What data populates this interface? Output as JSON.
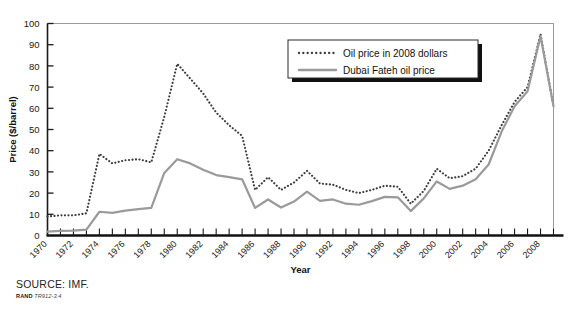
{
  "figure": {
    "source_text": "SOURCE: IMF.",
    "rand_label": "RAND",
    "rand_id": "TR912-3.4"
  },
  "chart_data": {
    "type": "line",
    "title": "",
    "xlabel": "Year",
    "ylabel": "Price ($/barrel)",
    "xlim": [
      1970,
      2009
    ],
    "ylim": [
      0,
      100
    ],
    "ytick_step": 10,
    "yticks": [
      0,
      10,
      20,
      30,
      40,
      50,
      60,
      70,
      80,
      90,
      100
    ],
    "xticks": [
      1970,
      1972,
      1974,
      1976,
      1978,
      1980,
      1982,
      1984,
      1986,
      1988,
      1990,
      1992,
      1994,
      1996,
      1998,
      2000,
      2002,
      2004,
      2006,
      2008
    ],
    "xtick_minor_step": 1,
    "grid": false,
    "legend_position": "top-center-right",
    "x": [
      1970,
      1971,
      1972,
      1973,
      1974,
      1975,
      1976,
      1977,
      1978,
      1979,
      1980,
      1981,
      1982,
      1983,
      1984,
      1985,
      1986,
      1987,
      1988,
      1989,
      1990,
      1991,
      1992,
      1993,
      1994,
      1995,
      1996,
      1997,
      1998,
      1999,
      2000,
      2001,
      2002,
      2003,
      2004,
      2005,
      2006,
      2007,
      2008,
      2009
    ],
    "series": [
      {
        "name": "Oil price in 2008 dollars",
        "style": "dotted",
        "color": "#3d3d3d",
        "values": [
          9,
          9.5,
          9.5,
          10.5,
          38.5,
          34,
          35.5,
          36,
          34.5,
          56,
          81,
          74,
          67,
          58,
          52,
          47,
          21.5,
          27.5,
          21.5,
          25,
          30.5,
          24.5,
          24,
          21.5,
          20,
          21.5,
          23.5,
          23,
          15,
          21,
          31.5,
          27,
          28,
          31.5,
          40,
          52,
          63,
          70,
          95,
          61
        ]
      },
      {
        "name": "Dubai Fateh oil price",
        "style": "solid",
        "color": "#9a9a9a",
        "values": [
          1.8,
          2.2,
          2.3,
          2.8,
          11.2,
          10.7,
          11.7,
          12.4,
          13,
          29.5,
          36,
          34,
          31,
          28.5,
          27.5,
          26.5,
          13,
          17,
          13.2,
          16,
          20.7,
          16.3,
          17,
          15,
          14.5,
          16.2,
          18.2,
          18,
          11.5,
          17.5,
          25.5,
          22,
          23.5,
          26.5,
          33.5,
          49,
          61,
          68,
          94,
          61
        ]
      }
    ]
  }
}
